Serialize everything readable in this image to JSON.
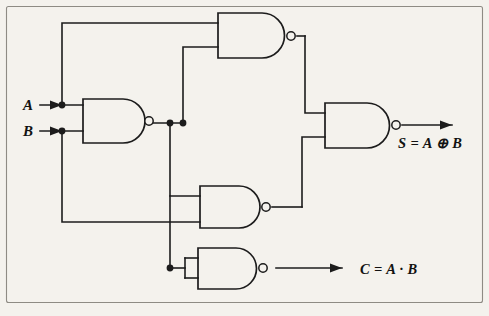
{
  "diagram": {
    "background_color": "#f4f2ed",
    "ink_color": "#1c1c1c",
    "frame_color": "#8e8b84",
    "inputs": [
      {
        "id": "A",
        "label": "A",
        "x": 28,
        "y": 110
      },
      {
        "id": "B",
        "label": "B",
        "x": 28,
        "y": 136
      }
    ],
    "outputs": [
      {
        "id": "S",
        "label": "S = A ⊕ B",
        "x": 398,
        "y": 148
      },
      {
        "id": "C",
        "label": "C = A · B",
        "x": 360,
        "y": 274
      }
    ],
    "gates": [
      {
        "id": "g1",
        "type": "NAND",
        "name": "top-nand-gate"
      },
      {
        "id": "g2",
        "type": "NAND",
        "name": "input-nand-gate"
      },
      {
        "id": "g3",
        "type": "NAND",
        "name": "middle-nand-gate"
      },
      {
        "id": "g4",
        "type": "NAND",
        "name": "sum-nand-gate"
      },
      {
        "id": "g5",
        "type": "NAND",
        "name": "carry-inverter-nand-gate"
      }
    ]
  }
}
